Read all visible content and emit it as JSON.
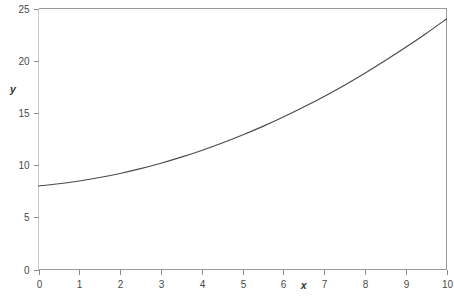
{
  "chart_data": {
    "type": "line",
    "title": "",
    "subtitle": "",
    "xlabel": "x",
    "ylabel": "y",
    "xlim": [
      0,
      10
    ],
    "ylim": [
      0,
      25
    ],
    "xticks": [
      0,
      1,
      2,
      3,
      4,
      5,
      6,
      7,
      8,
      9,
      10
    ],
    "xtick_labels": [
      "0",
      "1",
      "2",
      "3",
      "4",
      "5",
      "6",
      "7",
      "8",
      "9",
      "10"
    ],
    "yticks": [
      0,
      5,
      10,
      15,
      20,
      25
    ],
    "ytick_labels": [
      "0",
      "5",
      "10",
      "15",
      "20",
      "25"
    ],
    "grid": false,
    "legend": null,
    "legend_position": "none",
    "annotations": [],
    "series": [
      {
        "name": "curve",
        "color": "#4a4a4a",
        "x": [
          0,
          0.5,
          1,
          1.5,
          2,
          2.5,
          3,
          3.5,
          4,
          4.5,
          5,
          5.5,
          6,
          6.5,
          7,
          7.5,
          8,
          8.5,
          9,
          9.5,
          10
        ],
        "values": [
          8.0,
          8.21,
          8.48,
          8.81,
          9.2,
          9.66,
          10.18,
          10.76,
          11.4,
          12.11,
          12.88,
          13.71,
          14.6,
          15.56,
          16.58,
          17.66,
          18.8,
          20.01,
          21.28,
          22.61,
          24.0
        ]
      }
    ]
  },
  "axes": {
    "y_axis_label": "y",
    "x_axis_label": "x"
  },
  "colors": {
    "curve": "#4a4a4a",
    "frame": "#9a9a9a",
    "frame_faint": "#c9c9c9",
    "tick": "#8a8a8a",
    "text": "#4a4a4a",
    "background": "#ffffff"
  }
}
